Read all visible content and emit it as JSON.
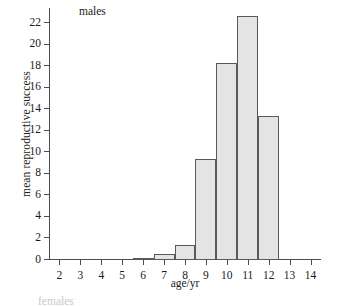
{
  "chart_data": {
    "type": "bar",
    "title": "males",
    "xlabel": "age/yr",
    "ylabel": "mean reproductive success",
    "categories": [
      2,
      3,
      4,
      5,
      6,
      7,
      8,
      9,
      10,
      11,
      12,
      13,
      14
    ],
    "values": [
      0,
      0,
      0,
      0,
      0.2,
      0.6,
      1.35,
      9.4,
      18.3,
      22.7,
      13.35,
      0,
      0
    ],
    "xlim": [
      1.5,
      14.5
    ],
    "ylim": [
      0,
      23.4
    ],
    "xticks": [
      2,
      3,
      4,
      5,
      6,
      7,
      8,
      9,
      10,
      11,
      12,
      13,
      14
    ],
    "yticks": [
      0,
      2,
      4,
      6,
      8,
      10,
      12,
      14,
      16,
      18,
      20,
      22
    ],
    "bar_width": 1,
    "grid": false,
    "legend": false,
    "bar_fill_color": "#e4e4e4",
    "bar_edge_color": "#595959",
    "axis_color": "#4d4d4d",
    "background_color": "#ffffff"
  },
  "annotations": {
    "cropped_next_panel_title": "females"
  }
}
